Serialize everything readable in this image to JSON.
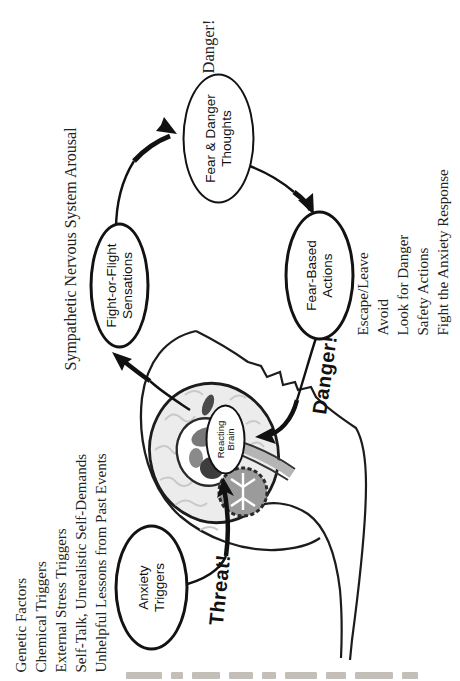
{
  "diagram": {
    "nodes": {
      "anxiety_triggers": {
        "line1": "Anxiety",
        "line2": "Triggers"
      },
      "reacting_brain": {
        "line1": "Reacting",
        "line2": "Brain"
      },
      "fight_or_flight": {
        "line1": "Fight-or-Flight",
        "line2": "Sensations"
      },
      "fear_danger_thoughts": {
        "line1": "Fear & Danger",
        "line2": "Thoughts"
      },
      "fear_based_actions": {
        "line1": "Fear-Based",
        "line2": "Actions"
      }
    },
    "annotations": {
      "arousal_label": "Sympathetic Nervous System Arousal",
      "danger_thought_label": "Danger!",
      "threat_shout_label": "Threat!",
      "danger_shout_label": "Danger!"
    },
    "trigger_list": {
      "items": [
        "Genetic Factors",
        "Chemical Triggers",
        "External Stress Triggers",
        "Self-Talk, Unrealistic Self-Demands",
        "Unhelpful Lessons from Past Events"
      ]
    },
    "action_list": {
      "items": [
        "Escape/Leave",
        "Avoid",
        "Look for Danger",
        "Safety Actions",
        "Fight the Anxiety Response"
      ]
    },
    "colors": {
      "ink": "#1a1a1a",
      "cortex_fill": "#ececec",
      "gyri": "#c9c9c9",
      "limbic_dark": "#3d3d3d",
      "limbic_mid": "#787878",
      "cerebellum_fill": "#9b9b9b",
      "brainstem_fill": "#b5b5b5"
    }
  }
}
